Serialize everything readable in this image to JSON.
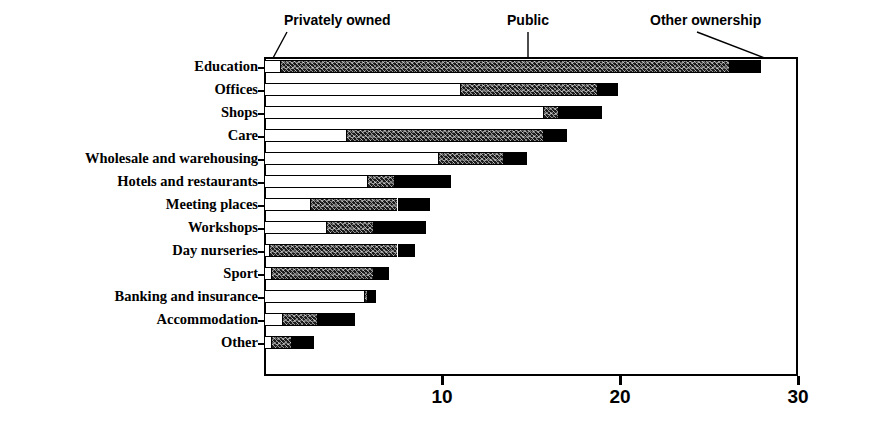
{
  "chart_data": {
    "type": "bar",
    "orientation": "horizontal",
    "stacked": true,
    "title": "",
    "xlabel": "",
    "ylabel": "",
    "xlim": [
      0,
      30
    ],
    "xticks": [
      {
        "value": 0,
        "label": ""
      },
      {
        "value": 10,
        "label": "10"
      },
      {
        "value": 20,
        "label": "20"
      },
      {
        "value": 30,
        "label": "30"
      }
    ],
    "grid": false,
    "legend_position": "top-callouts",
    "series": [
      {
        "name": "Privately owned",
        "fill": "white",
        "values": [
          0.9,
          11.0,
          15.7,
          4.6,
          9.8,
          5.8,
          2.6,
          3.5,
          0.3,
          0.4,
          5.6,
          1.0,
          0.4
        ]
      },
      {
        "name": "Public",
        "fill": "speckled-dark",
        "values": [
          25.2,
          7.7,
          0.8,
          11.1,
          3.6,
          1.5,
          4.9,
          2.6,
          7.2,
          5.7,
          0.2,
          2.0,
          1.1
        ]
      },
      {
        "name": "Other ownership",
        "fill": "black",
        "values": [
          1.8,
          1.2,
          2.5,
          1.3,
          1.4,
          3.2,
          1.8,
          3.0,
          1.0,
          0.9,
          0.5,
          2.1,
          1.3
        ]
      }
    ],
    "categories": [
      "Education",
      "Offices",
      "Shops",
      "Care",
      "Wholesale and warehousing",
      "Hotels and restaurants",
      "Meeting places",
      "Workshops",
      "Day nurseries",
      "Sport",
      "Banking and insurance",
      "Accommodation",
      "Other"
    ],
    "totals": [
      27.9,
      19.9,
      19.0,
      17.0,
      14.8,
      10.5,
      9.3,
      9.1,
      8.5,
      7.0,
      6.3,
      5.1,
      2.8
    ],
    "callouts": [
      {
        "label": "Privately owned",
        "points_to": "education-private-segment"
      },
      {
        "label": "Public",
        "points_to": "education-public-segment"
      },
      {
        "label": "Other ownership",
        "points_to": "education-other-segment"
      }
    ],
    "colors": {
      "private": "#ffffff",
      "public": "#1b1b1b",
      "other": "#000000",
      "axis": "#000000",
      "background": "#ffffff"
    }
  }
}
